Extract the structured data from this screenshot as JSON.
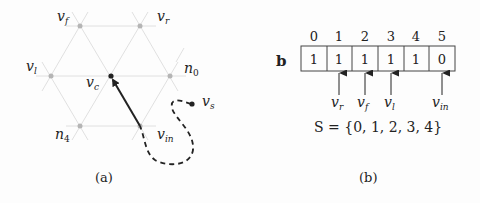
{
  "panel_a": {
    "caption": "(a)",
    "nodes": {
      "v_f": {
        "name": "v",
        "sub": "f"
      },
      "v_r": {
        "name": "v",
        "sub": "r"
      },
      "v_l": {
        "name": "v",
        "sub": "l"
      },
      "v_c": {
        "name": "v",
        "sub": "c"
      },
      "n_0": {
        "name": "n",
        "sub": "0"
      },
      "n_4": {
        "name": "n",
        "sub": "4"
      },
      "v_in": {
        "name": "v",
        "sub": "in"
      },
      "v_s": {
        "name": "v",
        "sub": "s"
      }
    }
  },
  "panel_b": {
    "caption": "(b)",
    "array_label": "b",
    "indices": [
      "0",
      "1",
      "2",
      "3",
      "4",
      "5"
    ],
    "values": [
      "1",
      "1",
      "1",
      "1",
      "1",
      "0"
    ],
    "pointers": [
      {
        "index": 1,
        "name": "v",
        "sub": "r"
      },
      {
        "index": 2,
        "name": "v",
        "sub": "f"
      },
      {
        "index": 3,
        "name": "v",
        "sub": "l"
      },
      {
        "index": 5,
        "name": "v",
        "sub": "in"
      }
    ],
    "set_expression": "S = {0, 1, 2, 3, 4}"
  },
  "colors": {
    "grid_line": "#d8d8d8",
    "vertex": "#b5b5b5",
    "ink": "#222222"
  }
}
